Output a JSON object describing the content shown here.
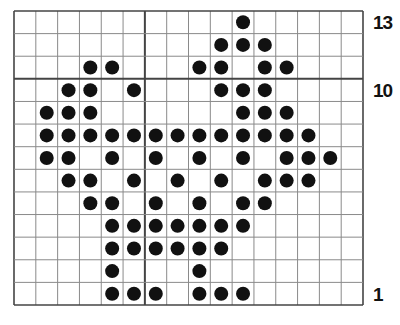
{
  "chart_data": {
    "type": "table",
    "title": "",
    "grid": {
      "columns": 16,
      "rows": 13,
      "thick_vertical_after_column": 6,
      "thick_horizontal_after_row_from_top": 3
    },
    "row_labels": [
      {
        "row": 13,
        "text": "13"
      },
      {
        "row": 10,
        "text": "10"
      },
      {
        "row": 1,
        "text": "1"
      }
    ],
    "rows": [
      {
        "row": 13,
        "filled_columns": [
          10
        ]
      },
      {
        "row": 12,
        "filled_columns": [
          9,
          10,
          11
        ]
      },
      {
        "row": 11,
        "filled_columns": [
          3,
          4,
          8,
          9,
          11,
          12
        ]
      },
      {
        "row": 10,
        "filled_columns": [
          2,
          3,
          5,
          9,
          10,
          11
        ]
      },
      {
        "row": 9,
        "filled_columns": [
          1,
          2,
          3,
          10,
          11,
          12
        ]
      },
      {
        "row": 8,
        "filled_columns": [
          1,
          2,
          3,
          4,
          5,
          6,
          7,
          8,
          9,
          10,
          11,
          12,
          13
        ]
      },
      {
        "row": 7,
        "filled_columns": [
          1,
          2,
          4,
          6,
          8,
          10,
          12,
          13,
          14
        ]
      },
      {
        "row": 6,
        "filled_columns": [
          2,
          3,
          5,
          7,
          9,
          11,
          12,
          13
        ]
      },
      {
        "row": 5,
        "filled_columns": [
          3,
          4,
          6,
          8,
          10,
          11
        ]
      },
      {
        "row": 4,
        "filled_columns": [
          4,
          5,
          6,
          7,
          8,
          9,
          10
        ]
      },
      {
        "row": 3,
        "filled_columns": [
          4,
          5,
          6,
          7,
          8,
          9
        ]
      },
      {
        "row": 2,
        "filled_columns": [
          4,
          8
        ]
      },
      {
        "row": 1,
        "filled_columns": [
          4,
          5,
          6,
          8,
          9,
          10
        ]
      }
    ],
    "colors": {
      "grid_line": "#8a8a8a",
      "thick_line": "#444444",
      "dot": "#111111",
      "background": "#ffffff"
    }
  }
}
